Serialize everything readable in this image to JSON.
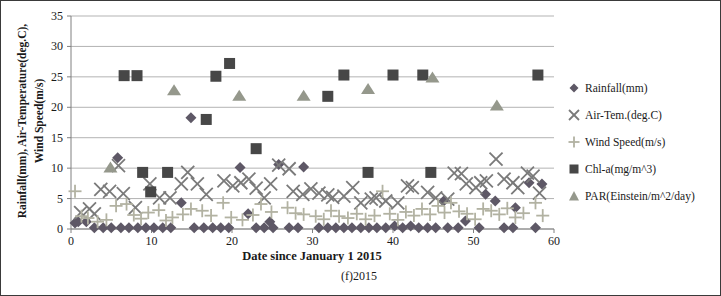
{
  "figure": {
    "caption": "(f)2015"
  },
  "chart_data": {
    "type": "scatter",
    "title": "",
    "xlabel": "Date since January 1 2015",
    "ylabel_line1": "Rainfall(mm), Air-Temperature(deg.C),",
    "ylabel_line2": "Wind Speed(m/s)",
    "xlim": [
      0,
      60
    ],
    "ylim": [
      0,
      35
    ],
    "xticks": [
      0,
      10,
      20,
      30,
      40,
      50,
      60
    ],
    "yticks": [
      0,
      5,
      10,
      15,
      20,
      25,
      30,
      35
    ],
    "grid": true,
    "legend_position": "right",
    "axis_color": "#808080",
    "grid_color": "#b3b3b3",
    "text_color": "#1a1a1a",
    "series": [
      {
        "name": "Rainfall(mm)",
        "marker": "diamond",
        "color": "#5e5866",
        "points": [
          [
            0.5,
            1.0
          ],
          [
            0.9,
            1.2
          ],
          [
            1.9,
            1.2
          ],
          [
            2.9,
            0.2
          ],
          [
            4.0,
            0.2
          ],
          [
            5.0,
            0.2
          ],
          [
            5.8,
            11.7
          ],
          [
            6.2,
            0.2
          ],
          [
            7.2,
            0.2
          ],
          [
            8.3,
            0.2
          ],
          [
            9.3,
            0.2
          ],
          [
            10.3,
            0.2
          ],
          [
            11.4,
            0.2
          ],
          [
            12.4,
            0.2
          ],
          [
            13.7,
            4.3
          ],
          [
            14.9,
            18.3
          ],
          [
            15.3,
            0.2
          ],
          [
            16.5,
            0.2
          ],
          [
            17.6,
            0.2
          ],
          [
            18.6,
            0.2
          ],
          [
            19.6,
            0.2
          ],
          [
            21.0,
            10.1
          ],
          [
            22.0,
            2.5
          ],
          [
            23.0,
            0.2
          ],
          [
            24.0,
            0.2
          ],
          [
            24.7,
            1.2
          ],
          [
            25.1,
            0.2
          ],
          [
            25.8,
            10.6
          ],
          [
            27.1,
            0.2
          ],
          [
            28.2,
            0.2
          ],
          [
            28.9,
            10.2
          ],
          [
            30.8,
            0.2
          ],
          [
            31.9,
            0.2
          ],
          [
            32.9,
            0.2
          ],
          [
            33.9,
            0.2
          ],
          [
            34.9,
            0.2
          ],
          [
            36.0,
            0.2
          ],
          [
            37.0,
            0.2
          ],
          [
            38.0,
            0.2
          ],
          [
            39.1,
            0.2
          ],
          [
            40.2,
            0.5
          ],
          [
            41.2,
            0.2
          ],
          [
            42.2,
            0.5
          ],
          [
            43.2,
            0.2
          ],
          [
            44.3,
            0.2
          ],
          [
            45.3,
            0.2
          ],
          [
            46.3,
            4.6
          ],
          [
            46.8,
            0.2
          ],
          [
            48.1,
            0.2
          ],
          [
            49.0,
            1.3
          ],
          [
            50.7,
            0.2
          ],
          [
            51.5,
            5.7
          ],
          [
            52.7,
            4.6
          ],
          [
            53.8,
            0.2
          ],
          [
            54.9,
            0.2
          ],
          [
            55.2,
            3.5
          ],
          [
            56.9,
            7.6
          ],
          [
            57.7,
            0.2
          ],
          [
            58.5,
            7.4
          ]
        ]
      },
      {
        "name": "Air-Tem.(deg.C)",
        "marker": "x",
        "color": "#7a7a7a",
        "points": [
          [
            1.2,
            2.7
          ],
          [
            2.3,
            3.3
          ],
          [
            2.9,
            2.5
          ],
          [
            3.7,
            6.5
          ],
          [
            4.8,
            6.2
          ],
          [
            5.9,
            10.4
          ],
          [
            6.5,
            5.8
          ],
          [
            8.0,
            3.5
          ],
          [
            9.8,
            7.4
          ],
          [
            11.0,
            5.1
          ],
          [
            12.3,
            5.1
          ],
          [
            13.7,
            7.4
          ],
          [
            14.5,
            9.3
          ],
          [
            15.7,
            7.4
          ],
          [
            16.8,
            5.7
          ],
          [
            19.0,
            7.9
          ],
          [
            20.1,
            7.1
          ],
          [
            21.1,
            7.6
          ],
          [
            22.1,
            8.2
          ],
          [
            23.0,
            6.7
          ],
          [
            24.0,
            5.1
          ],
          [
            24.8,
            7.4
          ],
          [
            25.8,
            10.5
          ],
          [
            27.1,
            9.9
          ],
          [
            27.6,
            6.2
          ],
          [
            28.8,
            5.7
          ],
          [
            29.8,
            6.6
          ],
          [
            30.8,
            5.9
          ],
          [
            31.9,
            5.6
          ],
          [
            32.5,
            5.2
          ],
          [
            33.9,
            5.4
          ],
          [
            35.0,
            6.8
          ],
          [
            36.0,
            4.3
          ],
          [
            37.3,
            4.9
          ],
          [
            37.9,
            5.1
          ],
          [
            39.1,
            4.6
          ],
          [
            40.6,
            4.3
          ],
          [
            41.8,
            7.1
          ],
          [
            42.4,
            6.8
          ],
          [
            44.3,
            6.0
          ],
          [
            45.3,
            5.1
          ],
          [
            46.8,
            4.9
          ],
          [
            47.6,
            9.2
          ],
          [
            48.5,
            9.1
          ],
          [
            49.1,
            7.4
          ],
          [
            50.3,
            6.8
          ],
          [
            50.9,
            7.6
          ],
          [
            51.6,
            7.9
          ],
          [
            52.8,
            11.5
          ],
          [
            53.8,
            8.2
          ],
          [
            54.9,
            7.6
          ],
          [
            55.5,
            6.8
          ],
          [
            56.7,
            9.2
          ],
          [
            57.4,
            8.7
          ],
          [
            58.2,
            5.9
          ]
        ]
      },
      {
        "name": "Wind Speed(m/s)",
        "marker": "plus",
        "color": "#b2b2a2",
        "points": [
          [
            0.5,
            6.2
          ],
          [
            1.3,
            2.1
          ],
          [
            2.1,
            1.8
          ],
          [
            3.3,
            1.2
          ],
          [
            4.4,
            1.5
          ],
          [
            5.6,
            3.8
          ],
          [
            6.9,
            4.1
          ],
          [
            7.8,
            2.3
          ],
          [
            8.7,
            1.7
          ],
          [
            9.6,
            2.7
          ],
          [
            10.9,
            3.1
          ],
          [
            11.8,
            1.4
          ],
          [
            12.6,
            1.9
          ],
          [
            13.9,
            2.4
          ],
          [
            14.9,
            3.3
          ],
          [
            16.3,
            3.0
          ],
          [
            17.4,
            2.2
          ],
          [
            18.9,
            4.3
          ],
          [
            19.9,
            1.9
          ],
          [
            21.3,
            1.5
          ],
          [
            22.6,
            2.3
          ],
          [
            23.6,
            4.1
          ],
          [
            24.9,
            2.8
          ],
          [
            26.9,
            3.5
          ],
          [
            27.9,
            2.6
          ],
          [
            28.9,
            2.4
          ],
          [
            30.4,
            2.1
          ],
          [
            31.4,
            1.6
          ],
          [
            32.3,
            3.0
          ],
          [
            33.3,
            2.1
          ],
          [
            34.4,
            1.8
          ],
          [
            35.5,
            2.5
          ],
          [
            36.6,
            1.6
          ],
          [
            37.7,
            2.2
          ],
          [
            38.7,
            6.2
          ],
          [
            39.6,
            2.5
          ],
          [
            40.6,
            1.5
          ],
          [
            41.6,
            2.8
          ],
          [
            42.6,
            2.2
          ],
          [
            43.6,
            3.3
          ],
          [
            44.6,
            2.4
          ],
          [
            45.6,
            3.8
          ],
          [
            46.4,
            2.7
          ],
          [
            47.2,
            4.3
          ],
          [
            48.2,
            2.9
          ],
          [
            49.2,
            2.5
          ],
          [
            50.2,
            1.6
          ],
          [
            51.2,
            3.3
          ],
          [
            52.2,
            3.0
          ],
          [
            53.2,
            2.4
          ],
          [
            54.2,
            3.4
          ],
          [
            55.2,
            1.9
          ],
          [
            56.2,
            2.6
          ],
          [
            57.7,
            4.3
          ],
          [
            58.6,
            2.2
          ]
        ]
      },
      {
        "name": "Chl-a(mg/m^3)",
        "marker": "square",
        "color": "#474747",
        "points": [
          [
            6.6,
            25.2
          ],
          [
            8.2,
            25.2
          ],
          [
            8.9,
            9.3
          ],
          [
            9.9,
            6.1
          ],
          [
            12.0,
            9.3
          ],
          [
            16.8,
            18.0
          ],
          [
            18.0,
            25.1
          ],
          [
            19.7,
            27.2
          ],
          [
            23.0,
            13.2
          ],
          [
            31.9,
            21.8
          ],
          [
            33.9,
            25.3
          ],
          [
            36.9,
            9.3
          ],
          [
            40.0,
            25.3
          ],
          [
            43.7,
            25.3
          ],
          [
            44.7,
            9.3
          ],
          [
            58.0,
            25.3
          ]
        ]
      },
      {
        "name": "PAR(Einstein/m^2/day)",
        "marker": "triangle",
        "color": "#95988c",
        "points": [
          [
            4.9,
            10.1
          ],
          [
            12.8,
            22.8
          ],
          [
            20.9,
            21.9
          ],
          [
            28.9,
            21.9
          ],
          [
            36.9,
            23.0
          ],
          [
            44.9,
            24.9
          ],
          [
            52.9,
            20.3
          ]
        ]
      }
    ]
  }
}
